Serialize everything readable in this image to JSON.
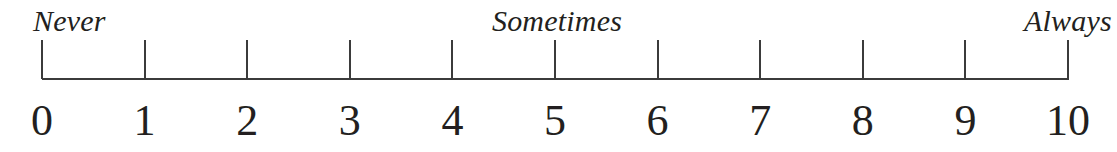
{
  "figure": {
    "kind": "rating-scale-ruler",
    "line_color": "#3b3b3b",
    "text_color": "#231f20",
    "background_color": "#ffffff"
  },
  "anchors": {
    "left": "Never",
    "center": "Sometimes",
    "right": "Always"
  },
  "chart_data": {
    "type": "scatter",
    "title": "",
    "subtitle": "",
    "xlabel": "",
    "ylabel": "",
    "grid": false,
    "legend": "none",
    "orientation": "horizontal",
    "xlim": [
      0,
      10
    ],
    "x": [
      0,
      1,
      2,
      3,
      4,
      5,
      6,
      7,
      8,
      9,
      10
    ],
    "values": [
      0,
      1,
      2,
      3,
      4,
      5,
      6,
      7,
      8,
      9,
      10
    ],
    "tick_labels": [
      "0",
      "1",
      "2",
      "3",
      "4",
      "5",
      "6",
      "7",
      "8",
      "9",
      "10"
    ],
    "tick_interval": 1,
    "annotations": [
      {
        "text": "Never",
        "x": 0,
        "position": "above-left"
      },
      {
        "text": "Sometimes",
        "x": 5,
        "position": "above-center"
      },
      {
        "text": "Always",
        "x": 10,
        "position": "above-right"
      }
    ],
    "series": [
      {
        "name": "scale points",
        "values": [
          0,
          1,
          2,
          3,
          4,
          5,
          6,
          7,
          8,
          9,
          10
        ]
      }
    ]
  }
}
